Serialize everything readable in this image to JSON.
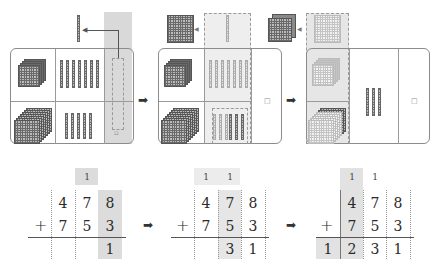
{
  "colors": {
    "highlight": "#d9d9d9",
    "highlight_light": "#eeeeee",
    "border": "#8c8c8c",
    "block": "#707070"
  },
  "stages": [
    {
      "name": "ones-regroup",
      "place_values": [
        "hundreds",
        "tens",
        "ones"
      ],
      "top_addend_blocks": {
        "hundreds": 4,
        "tens": 7,
        "ones": 8
      },
      "bottom_addend_blocks": {
        "hundreds": 7,
        "tens": 5,
        "ones": 3
      },
      "regroup_note": "10 ones become 1 ten",
      "remaining_ones_label": "□",
      "carry": [
        "",
        "1",
        ""
      ],
      "row1": [
        "",
        "4",
        "7",
        "8"
      ],
      "row2": [
        "+",
        "7",
        "5",
        "3"
      ],
      "result": [
        "",
        "",
        "",
        "1"
      ]
    },
    {
      "name": "tens-regroup",
      "regroup_note": "10 tens become 1 hundred",
      "remaining_ones_label": "□",
      "carry": [
        "1",
        "1",
        ""
      ],
      "row1": [
        "",
        "4",
        "7",
        "8"
      ],
      "row2": [
        "+",
        "7",
        "5",
        "3"
      ],
      "result": [
        "",
        "",
        "3",
        "1"
      ]
    },
    {
      "name": "hundreds-regroup",
      "regroup_note": "10 hundreds become 1 thousand",
      "remaining_ones_label": "□",
      "remaining_tens": 3,
      "carry": [
        "1",
        "1",
        ""
      ],
      "row1": [
        "",
        "4",
        "7",
        "8"
      ],
      "row2": [
        "+",
        "7",
        "5",
        "3"
      ],
      "result": [
        "1",
        "2",
        "3",
        "1"
      ]
    }
  ],
  "arrows": [
    "➡",
    "➡",
    "➡",
    "➡"
  ]
}
